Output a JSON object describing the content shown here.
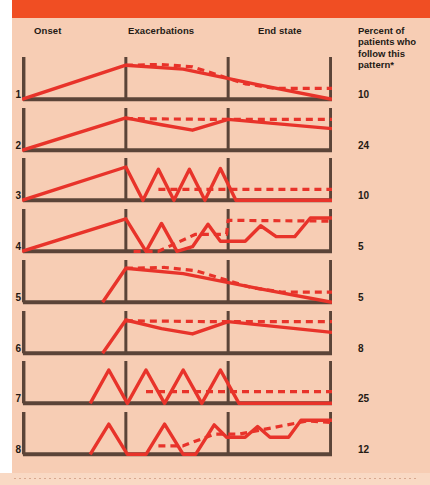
{
  "figure": {
    "background_color": "#f7cdb4",
    "banner_color": "#f04e23",
    "line_color": "#e8332a",
    "axis_color": "#5b4438",
    "text_color": "#241a14"
  },
  "headers": {
    "onset": "Onset",
    "exacerbations": "Exacerbations",
    "end_state": "End state",
    "percent_column": "Percent of patients who follow this pattern*"
  },
  "chart_data": {
    "type": "line",
    "xlabel": "",
    "ylabel": "",
    "grid": false,
    "legend": "none",
    "phases": [
      "Onset",
      "Exacerbations",
      "End state"
    ],
    "phase_divider_x": [
      0.335,
      0.665
    ],
    "categories": [
      "1",
      "2",
      "3",
      "4",
      "5",
      "6",
      "7",
      "8"
    ],
    "series_name": "Percent of patients who follow this pattern",
    "values": [
      10,
      24,
      10,
      5,
      5,
      8,
      25,
      12
    ],
    "units": "percent",
    "panels": [
      {
        "id": "1",
        "percent": 10,
        "onset": "gradual",
        "end_state": "remission",
        "solid_points": "0,100 33.5,12 52,22 76,62 100,100",
        "dashed_points": "33.5,12 45,10 55,16 72,60 82,72 100,72"
      },
      {
        "id": "2",
        "percent": 24,
        "onset": "gradual",
        "end_state": "relapsing-stable",
        "solid_points": "0,100 33.5,16 45,34 55,48 66.5,20 100,44",
        "dashed_points": "33.5,18 60,20 100,20"
      },
      {
        "id": "3",
        "percent": 10,
        "onset": "gradual",
        "end_state": "stable-plateau",
        "solid_points": "0,100 33.5,14 39,100 44,20 49,100 54,20 59,100 64,18 69,100 100,100",
        "dashed_points": "44,72 66.5,72 100,72"
      },
      {
        "id": "4",
        "percent": 5,
        "onset": "gradual",
        "end_state": "progressive-decline",
        "solid_points": "0,100 33.5,16 40,100 45,28 50,100 55,88 60,30 64,74 72,74 77,34 82,62 88,62 93,14 100,14",
        "dashed_points": "36,100 44,100 56,56 66,56 66.5,20 100,22"
      },
      {
        "id": "5",
        "percent": 5,
        "onset": "abrupt",
        "end_state": "remission",
        "solid_points": "26,100 33.5,12 52,26 76,64 100,100",
        "dashed_points": "33.5,12 46,10 56,18 74,62 84,74 100,74"
      },
      {
        "id": "6",
        "percent": 8,
        "onset": "abrupt",
        "end_state": "relapsing-stable",
        "solid_points": "26,100 33.5,14 45,36 55,50 66.5,18 100,46",
        "dashed_points": "33.5,16 60,18 100,18"
      },
      {
        "id": "7",
        "percent": 25,
        "onset": "relapsing",
        "end_state": "full-remission",
        "solid_points": "22,100 28,14 34,100 40,14 46,100 52,14 58,100 64,14 70,100 100,100",
        "dashed_points": "40,70 66.5,70 100,70"
      },
      {
        "id": "8",
        "percent": 12,
        "onset": "relapsing",
        "end_state": "progressive-decline",
        "solid_points": "22,100 28,22 34,100 40,100 46,22 52,100 56,100 62,24 66,56 72,56 76,28 80,56 86,56 90,12 100,12",
        "dashed_points": "44,78 52,78 62,48 70,48 92,14 100,18"
      }
    ]
  }
}
